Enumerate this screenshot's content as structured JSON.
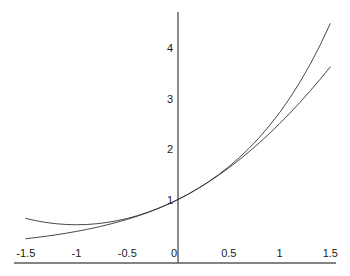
{
  "chart_data": {
    "type": "line",
    "title": "",
    "subtitle": "",
    "xlabel": "",
    "ylabel": "",
    "xlim": [
      -1.5,
      1.5
    ],
    "ylim": [
      0,
      4.6
    ],
    "grid": false,
    "legend": null,
    "legend_position": "none",
    "axis_style": "centered-y-axis-at-zero",
    "xticks": [
      -1.5,
      -1,
      -0.5,
      0,
      0.5,
      1,
      1.5
    ],
    "xtick_labels": [
      "-1.5",
      "-1",
      "-0.5",
      "0",
      "0.5",
      "1",
      "1.5"
    ],
    "yticks": [
      0,
      1,
      2,
      3,
      4
    ],
    "ytick_labels": [
      "0",
      "1",
      "2",
      "3",
      "4"
    ],
    "series": [
      {
        "name": "exp(x)",
        "color": "#333333",
        "x": [
          -1.5,
          -1.4,
          -1.3,
          -1.2,
          -1.1,
          -1,
          -0.9,
          -0.8,
          -0.7,
          -0.6,
          -0.5,
          -0.4,
          -0.3,
          -0.2,
          -0.1,
          0,
          0.1,
          0.2,
          0.3,
          0.4,
          0.5,
          0.6,
          0.7,
          0.8,
          0.9,
          1,
          1.1,
          1.2,
          1.3,
          1.4,
          1.5
        ],
        "values": [
          0.223,
          0.247,
          0.273,
          0.301,
          0.333,
          0.368,
          0.407,
          0.449,
          0.497,
          0.549,
          0.607,
          0.67,
          0.741,
          0.819,
          0.905,
          1,
          1.105,
          1.221,
          1.35,
          1.492,
          1.649,
          1.822,
          2.014,
          2.226,
          2.46,
          2.718,
          3.004,
          3.32,
          3.669,
          4.055,
          4.482
        ]
      },
      {
        "name": "1 + x + x^2/2",
        "color": "#333333",
        "x": [
          -1.5,
          -1.4,
          -1.3,
          -1.2,
          -1.1,
          -1,
          -0.9,
          -0.8,
          -0.7,
          -0.6,
          -0.5,
          -0.4,
          -0.3,
          -0.2,
          -0.1,
          0,
          0.1,
          0.2,
          0.3,
          0.4,
          0.5,
          0.6,
          0.7,
          0.8,
          0.9,
          1,
          1.1,
          1.2,
          1.3,
          1.4,
          1.5
        ],
        "values": [
          0.625,
          0.58,
          0.545,
          0.52,
          0.505,
          0.5,
          0.505,
          0.52,
          0.545,
          0.58,
          0.625,
          0.68,
          0.745,
          0.82,
          0.905,
          1,
          1.105,
          1.22,
          1.345,
          1.48,
          1.625,
          1.78,
          1.945,
          2.12,
          2.305,
          2.5,
          2.705,
          2.92,
          3.145,
          3.38,
          3.625
        ]
      }
    ]
  },
  "style": {
    "background_color": "#ffffff",
    "axis_color": "#5a5a5a",
    "curve_color": "#333333",
    "label_color": "#1a1a1a"
  }
}
